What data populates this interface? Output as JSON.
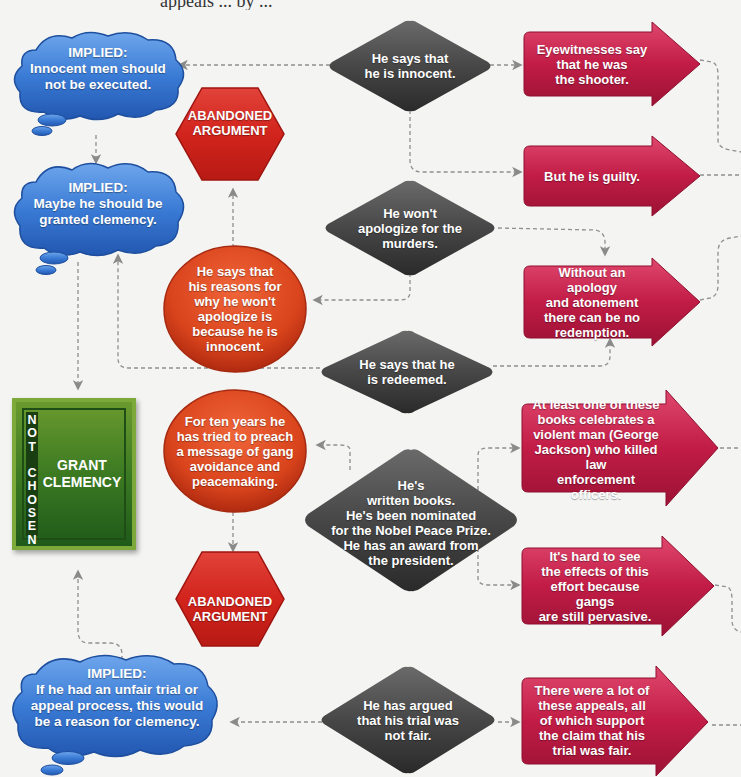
{
  "page": {
    "top_cut_text": "appeals ... by ..."
  },
  "colors": {
    "background": "#f4f4f3",
    "cloud_blue": "#3a7bd5",
    "diamond_gray": "#4a4a4a",
    "arrow_crimson": "#b8173e",
    "circle_orange": "#d94a1e",
    "hexagon_red": "#d8261e",
    "box_green": "#3c7a22",
    "connector_gray": "#8a8a8a"
  },
  "implied_clouds": [
    {
      "heading": "IMPLIED:",
      "text": "Innocent men should\nnot be executed."
    },
    {
      "heading": "IMPLIED:",
      "text": "Maybe he should be\ngranted clemency."
    },
    {
      "heading": "IMPLIED:",
      "text": "If he had an unfair trial or\nappeal process, this would\nbe a reason for clemency."
    }
  ],
  "claims": [
    {
      "text": "He says that\nhe is innocent."
    },
    {
      "text": "He won't\napologize for the\nmurders."
    },
    {
      "text": "He says that he\nis redeemed."
    },
    {
      "text": "He's\nwritten books.\nHe's been nominated\nfor the Nobel Peace Prize.\nHe has an award from\nthe president."
    },
    {
      "text": "He has argued\nthat his trial was\nnot fair."
    }
  ],
  "rebuttals": [
    {
      "text": "Eyewitnesses say\nthat he was\nthe shooter."
    },
    {
      "text": "But he is guilty."
    },
    {
      "text": "Without an apology\nand atonement\nthere can be no\nredemption."
    },
    {
      "text": "At least one of these\nbooks celebrates a\nviolent man (George\nJackson) who killed law\nenforcement officers."
    },
    {
      "text": "It's hard to see\nthe effects of this\neffort because gangs\nare still pervasive."
    },
    {
      "text": "There were a lot of\nthese appeals, all\nof which support\nthe claim that his\ntrial was fair."
    }
  ],
  "responses": [
    {
      "text": "He says that\nhis reasons for\nwhy he won't\napologize is\nbecause he is\ninnocent."
    },
    {
      "text": "For ten years he\nhas tried to preach\na message of gang\navoidance and\npeacemaking."
    }
  ],
  "abandoned": [
    {
      "text": "ABANDONED\nARGUMENT"
    },
    {
      "text": "ABANDONED\nARGUMENT"
    }
  ],
  "decision_box": {
    "status": "N\nO\nT\n \nC\nH\nO\nS\nE\nN",
    "title": "GRANT\nCLEMENCY"
  }
}
